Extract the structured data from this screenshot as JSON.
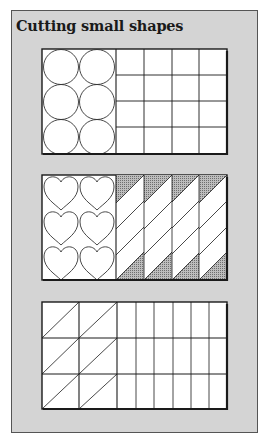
{
  "title": "Cutting small shapes",
  "colors": {
    "frame_bg": "#d4d4d4",
    "panel_bg": "#ffffff",
    "line": "#1a1a1a",
    "shade": "#a8a8a8"
  },
  "panels": [
    {
      "name": "circles-and-squares",
      "left_section": {
        "shape": "circle",
        "cols": 2,
        "rows": 3
      },
      "right_section": {
        "shape": "square-grid",
        "cols": 4,
        "rows": 4
      }
    },
    {
      "name": "hearts-and-diagonal-strips",
      "left_section": {
        "shape": "heart",
        "cols": 2,
        "rows": 3
      },
      "right_section": {
        "shape": "diagonal-strips",
        "cols": 4,
        "diagonals_per_col": 4,
        "shaded_corners": true
      }
    },
    {
      "name": "triangles-and-rectangles",
      "left_section": {
        "shape": "triangle",
        "cols": 2,
        "rows": 3
      },
      "right_section": {
        "shape": "rectangle-strips",
        "cols": 6,
        "rows": 3
      }
    }
  ]
}
